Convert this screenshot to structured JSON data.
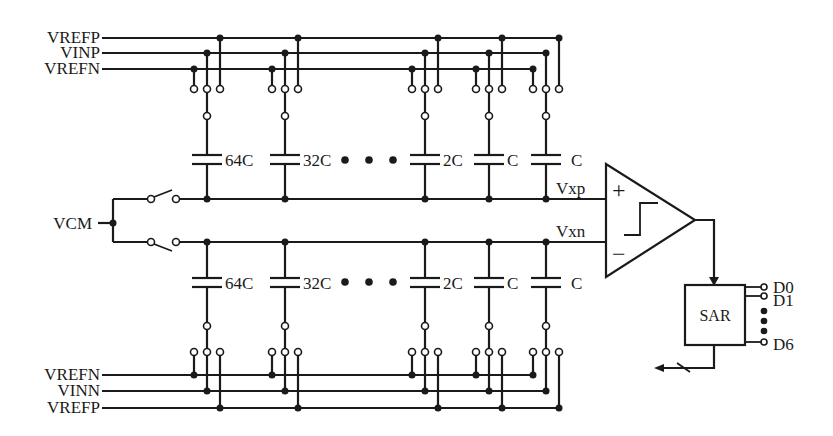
{
  "top_rails": [
    {
      "label": "VREFP",
      "y": 38
    },
    {
      "label": "VINP",
      "y": 53
    },
    {
      "label": "VREFN",
      "y": 69
    }
  ],
  "bottom_rails": [
    {
      "label": "VREFN",
      "y": 375
    },
    {
      "label": "VINN",
      "y": 391
    },
    {
      "label": "VREFP",
      "y": 408
    }
  ],
  "capacitors_top": [
    {
      "label": "64C",
      "x": 207
    },
    {
      "label": "32C",
      "x": 285
    },
    {
      "label": "2C",
      "x": 425
    },
    {
      "label": "C",
      "x": 489
    },
    {
      "label": "C",
      "x": 546
    }
  ],
  "capacitors_bottom": [
    {
      "label": "64C",
      "x": 207
    },
    {
      "label": "32C",
      "x": 285
    },
    {
      "label": "2C",
      "x": 425
    },
    {
      "label": "C",
      "x": 489
    },
    {
      "label": "C",
      "x": 546
    }
  ],
  "ellipsis": "• • •",
  "common_mode": {
    "label": "VCM"
  },
  "nodes": {
    "positive": "Vxp",
    "negative": "Vxn"
  },
  "comparator": {
    "plus": "+",
    "minus": "−"
  },
  "sar": {
    "label": "SAR",
    "outputs": [
      "D0",
      "D1",
      "D6"
    ]
  }
}
